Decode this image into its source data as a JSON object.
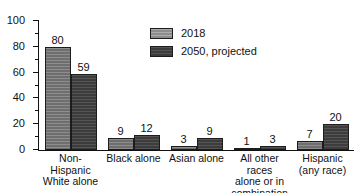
{
  "chart_data": {
    "type": "bar",
    "title": "",
    "subtitle": "",
    "xlabel": "",
    "ylabel": "",
    "ylim": [
      0,
      100
    ],
    "ytick_labels": [
      "0",
      "20",
      "40",
      "60",
      "80",
      "100"
    ],
    "ytick_values": [
      0,
      20,
      40,
      60,
      80,
      100
    ],
    "yminor_step": 10,
    "grid": false,
    "legend_position": "inside-top-center",
    "categories": [
      "Non-Hispanic\nWhite alone",
      "Black alone",
      "Asian alone",
      "All other races\nalone or in\ncombination",
      "Hispanic\n(any race)"
    ],
    "category_lines": [
      [
        "Non-Hispanic",
        "White alone"
      ],
      [
        "Black alone"
      ],
      [
        "Asian alone"
      ],
      [
        "All other races",
        "alone or in",
        "combination"
      ],
      [
        "Hispanic",
        "(any race)"
      ]
    ],
    "series": [
      {
        "name": "2018",
        "color": "#6e6e6e",
        "values": [
          80,
          9,
          3,
          1,
          7
        ],
        "labels": [
          "80",
          "9",
          "3",
          "1",
          "7"
        ]
      },
      {
        "name": "2050, projected",
        "color": "#3c3c3c",
        "values": [
          59,
          12,
          9,
          3,
          20
        ],
        "labels": [
          "59",
          "12",
          "9",
          "3",
          "20"
        ]
      }
    ]
  },
  "legend": {
    "items": [
      {
        "label": "2018",
        "swatch": "legend-swatch-2018"
      },
      {
        "label": "2050, projected",
        "swatch": "legend-swatch-2050"
      }
    ]
  },
  "axis": {
    "y_ticks": [
      "100",
      "80",
      "60",
      "40",
      "20",
      "0"
    ]
  }
}
